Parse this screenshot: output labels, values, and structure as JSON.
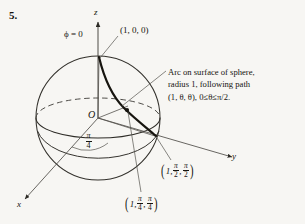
{
  "figure": {
    "problem_number": "5.",
    "axes": {
      "z_label": "z",
      "y_label": "y",
      "x_label": "x"
    },
    "origin_label": "O",
    "phi_label": "ϕ = 0",
    "point_north_pole": "(1, 0, 0)",
    "angle_label": {
      "numerator": "π",
      "denominator": "4"
    },
    "annotation": {
      "line1": "Arc on surface of sphere,",
      "line2": "radius 1, following path",
      "line3_prefix": "(1, θ, θ), 0≤θ≤π/2."
    },
    "point_equator": {
      "open_paren": "(",
      "radius": "1,",
      "theta": {
        "numerator": "π",
        "denominator": "2"
      },
      "comma": ",",
      "phi": {
        "numerator": "π",
        "denominator": "2"
      },
      "close_paren": ")"
    },
    "point_mid": {
      "open_paren": "(",
      "radius": "1,",
      "theta": {
        "numerator": "π",
        "denominator": "4"
      },
      "comma": ",",
      "phi": {
        "numerator": "π",
        "denominator": "4"
      },
      "close_paren": ")"
    },
    "colors": {
      "ink": "#15140f",
      "thin_line": "#4a4844",
      "paper": "#f7f6f3",
      "arc": "#17150f"
    }
  }
}
